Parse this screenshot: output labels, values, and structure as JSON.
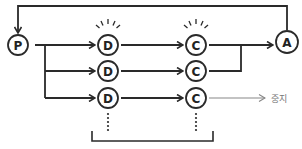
{
  "diagram": {
    "nodes": {
      "p": {
        "label": "P"
      },
      "a": {
        "label": "A"
      },
      "d1": {
        "label": "D"
      },
      "d2": {
        "label": "D"
      },
      "d3": {
        "label": "D"
      },
      "c1": {
        "label": "C"
      },
      "c2": {
        "label": "C"
      },
      "c3": {
        "label": "C"
      }
    },
    "stop_label": "중지",
    "colors": {
      "line": "#2a2a2a",
      "stop_line": "#888888",
      "stop_text": "#777777",
      "background": "#ffffff"
    }
  }
}
